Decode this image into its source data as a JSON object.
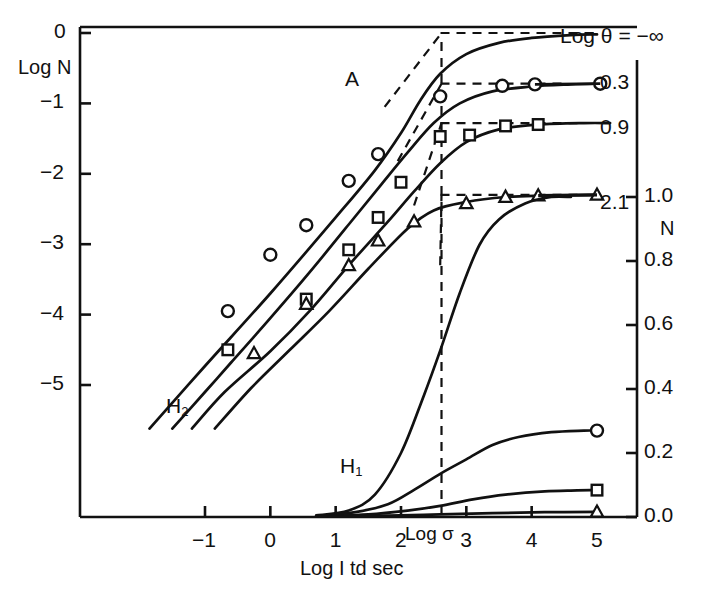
{
  "figure": {
    "left_axis_title": "Log N",
    "right_axis_title": "N",
    "x_axis_title": "Log I td sec",
    "sigma_annotation": "Log σ",
    "theta_legend": "Log θ = −∞",
    "curve_label_a": "A",
    "curve_label_h2": "H",
    "curve_label_h2_sub": "2",
    "curve_label_h1": "H",
    "curve_label_h1_sub": "1"
  },
  "axes": {
    "left_ticks": [
      "0",
      "−1",
      "−2",
      "−3",
      "−4",
      "−5"
    ],
    "left_values": [
      0,
      -1,
      -2,
      -3,
      -4,
      -5
    ],
    "right_ticks": [
      "1.0",
      "0.8",
      "0.6",
      "0.4",
      "0.2",
      "0.0"
    ],
    "right_values": [
      1.0,
      0.8,
      0.6,
      0.4,
      0.2,
      0.0
    ],
    "x_ticks": [
      "−1",
      "0",
      "1",
      "2",
      "3",
      "4",
      "5"
    ],
    "x_values": [
      -1,
      0,
      1,
      2,
      3,
      4,
      5
    ]
  },
  "theta_labels": [
    {
      "text": "Log θ = −∞",
      "y_logN": 0.0
    },
    {
      "text": "0.3",
      "y_logN": -0.72
    },
    {
      "text": "0.9",
      "y_logN": -1.28
    },
    {
      "text": "2.1",
      "y_logN": -2.3
    }
  ],
  "chart_data": {
    "type": "line",
    "title": "",
    "xlabel": "Log I td sec",
    "ylabel": "Log N",
    "ylabel_right": "N",
    "xlim": [
      -1.9,
      5.6
    ],
    "ylim": [
      -6.3,
      0.2
    ],
    "ylim_right": [
      0.0,
      1.0
    ],
    "grid": false,
    "legend": "right-margin, labelled by Log theta value",
    "annotations": [
      {
        "text": "Log θ = −∞",
        "x": 5.0,
        "y": 0.0
      },
      {
        "text": "0.3",
        "x": 5.4,
        "y": -0.72
      },
      {
        "text": "0.9",
        "x": 5.4,
        "y": -1.28
      },
      {
        "text": "2.1",
        "x": 5.4,
        "y": -2.3
      },
      {
        "text": "A",
        "x": 1.35,
        "y": -0.6
      },
      {
        "text": "H2",
        "x": 0.05,
        "y": -4.75
      },
      {
        "text": "H1",
        "x": 1.55,
        "y": -5.7
      },
      {
        "text": "Log σ",
        "x": 2.6,
        "y": -6.15
      }
    ],
    "vertical_dashed_line_x": 2.62,
    "series": [
      {
        "name": "Log θ = −∞",
        "marker": "none",
        "asymptote_logN": 0.0,
        "line": [
          [
            -1.85,
            -5.62
          ],
          [
            -1.0,
            -4.73
          ],
          [
            0.0,
            -3.7
          ],
          [
            1.0,
            -2.62
          ],
          [
            1.6,
            -1.95
          ],
          [
            2.0,
            -1.42
          ],
          [
            2.3,
            -0.95
          ],
          [
            2.6,
            -0.58
          ],
          [
            3.0,
            -0.3
          ],
          [
            3.5,
            -0.14
          ],
          [
            4.0,
            -0.07
          ],
          [
            4.6,
            -0.03
          ],
          [
            5.0,
            -0.02
          ]
        ],
        "points": []
      },
      {
        "name": "0.3",
        "marker": "circle",
        "asymptote_logN": -0.72,
        "line": [
          [
            -1.5,
            -5.62
          ],
          [
            -1.0,
            -5.1
          ],
          [
            -0.6,
            -4.68
          ],
          [
            0.0,
            -4.05
          ],
          [
            0.6,
            -3.4
          ],
          [
            1.2,
            -2.72
          ],
          [
            1.7,
            -2.15
          ],
          [
            2.1,
            -1.7
          ],
          [
            2.5,
            -1.28
          ],
          [
            2.9,
            -1.0
          ],
          [
            3.4,
            -0.83
          ],
          [
            4.0,
            -0.76
          ],
          [
            4.6,
            -0.73
          ],
          [
            5.05,
            -0.72
          ]
        ],
        "points": [
          [
            -0.65,
            -3.95
          ],
          [
            0.0,
            -3.15
          ],
          [
            0.55,
            -2.73
          ],
          [
            1.2,
            -2.1
          ],
          [
            1.65,
            -1.72
          ],
          [
            2.6,
            -0.9
          ],
          [
            3.55,
            -0.75
          ],
          [
            4.05,
            -0.73
          ],
          [
            5.05,
            -0.72
          ]
        ]
      },
      {
        "name": "0.9",
        "marker": "square",
        "asymptote_logN": -1.28,
        "line": [
          [
            -1.2,
            -5.62
          ],
          [
            -0.7,
            -5.1
          ],
          [
            0.0,
            -4.52
          ],
          [
            0.6,
            -3.95
          ],
          [
            1.2,
            -3.3
          ],
          [
            1.8,
            -2.68
          ],
          [
            2.2,
            -2.25
          ],
          [
            2.6,
            -1.85
          ],
          [
            3.0,
            -1.55
          ],
          [
            3.5,
            -1.37
          ],
          [
            4.1,
            -1.3
          ],
          [
            4.8,
            -1.28
          ],
          [
            5.2,
            -1.28
          ]
        ],
        "points": [
          [
            -0.65,
            -4.5
          ],
          [
            0.55,
            -3.78
          ],
          [
            1.2,
            -3.08
          ],
          [
            1.65,
            -2.62
          ],
          [
            2.0,
            -2.12
          ],
          [
            2.6,
            -1.47
          ],
          [
            3.05,
            -1.45
          ],
          [
            3.6,
            -1.32
          ],
          [
            4.1,
            -1.3
          ]
        ]
      },
      {
        "name": "2.1",
        "marker": "triangle",
        "asymptote_logN": -2.3,
        "line": [
          [
            -0.85,
            -5.62
          ],
          [
            -0.3,
            -5.05
          ],
          [
            0.3,
            -4.5
          ],
          [
            0.9,
            -3.95
          ],
          [
            1.5,
            -3.35
          ],
          [
            2.1,
            -2.78
          ],
          [
            2.5,
            -2.52
          ],
          [
            3.0,
            -2.4
          ],
          [
            3.6,
            -2.33
          ],
          [
            4.2,
            -2.31
          ],
          [
            5.0,
            -2.3
          ]
        ],
        "points": [
          [
            -0.25,
            -4.55
          ],
          [
            0.55,
            -3.85
          ],
          [
            1.2,
            -3.3
          ],
          [
            1.65,
            -2.95
          ],
          [
            2.2,
            -2.68
          ],
          [
            3.0,
            -2.42
          ],
          [
            3.6,
            -2.33
          ],
          [
            4.1,
            -2.31
          ],
          [
            5.0,
            -2.3
          ]
        ]
      },
      {
        "name": "H1 rising (N scale)",
        "marker": "none",
        "scale": "right",
        "line": [
          [
            0.7,
            0.005
          ],
          [
            1.2,
            0.02
          ],
          [
            1.6,
            0.07
          ],
          [
            2.0,
            0.2
          ],
          [
            2.35,
            0.38
          ],
          [
            2.6,
            0.52
          ],
          [
            2.9,
            0.7
          ],
          [
            3.2,
            0.85
          ],
          [
            3.5,
            0.93
          ],
          [
            3.9,
            0.98
          ],
          [
            4.3,
            1.0
          ],
          [
            4.6,
            1.0
          ]
        ],
        "points": []
      },
      {
        "name": "N circle curve",
        "marker": "circle",
        "scale": "right",
        "line": [
          [
            0.75,
            0.003
          ],
          [
            1.3,
            0.015
          ],
          [
            1.8,
            0.04
          ],
          [
            2.2,
            0.085
          ],
          [
            2.6,
            0.135
          ],
          [
            3.0,
            0.18
          ],
          [
            3.4,
            0.225
          ],
          [
            3.8,
            0.25
          ],
          [
            4.3,
            0.265
          ],
          [
            4.8,
            0.27
          ],
          [
            5.0,
            0.27
          ]
        ],
        "points": [
          [
            5.0,
            0.27
          ]
        ]
      },
      {
        "name": "N square curve",
        "marker": "square",
        "scale": "right",
        "line": [
          [
            0.8,
            0.002
          ],
          [
            1.5,
            0.008
          ],
          [
            2.1,
            0.02
          ],
          [
            2.6,
            0.035
          ],
          [
            3.1,
            0.055
          ],
          [
            3.6,
            0.07
          ],
          [
            4.2,
            0.08
          ],
          [
            4.7,
            0.083
          ],
          [
            5.0,
            0.084
          ]
        ],
        "points": [
          [
            5.0,
            0.084
          ]
        ]
      },
      {
        "name": "N triangle curve",
        "marker": "triangle",
        "scale": "right",
        "line": [
          [
            0.9,
            0.001
          ],
          [
            1.8,
            0.004
          ],
          [
            2.6,
            0.008
          ],
          [
            3.4,
            0.012
          ],
          [
            4.2,
            0.015
          ],
          [
            5.0,
            0.016
          ]
        ],
        "points": [
          [
            5.0,
            0.016
          ]
        ]
      }
    ],
    "dashed_asymptotes": [
      {
        "series": "Log θ = −∞",
        "y_logN": 0.0,
        "x_from": 2.62,
        "x_to": 5.0,
        "knee_x": 2.62,
        "knee_from": [
          1.75,
          -1.05
        ]
      },
      {
        "series": "0.3",
        "y_logN": -0.72,
        "x_from": 2.62,
        "x_to": 4.55,
        "knee_x": 2.62,
        "knee_from": [
          1.95,
          -1.82
        ]
      },
      {
        "series": "0.9",
        "y_logN": -1.28,
        "x_from": 2.62,
        "x_to": 4.75,
        "knee_x": 2.62,
        "knee_from": [
          2.2,
          -2.45
        ]
      },
      {
        "series": "2.1",
        "y_logN": -2.3,
        "x_from": 2.62,
        "x_to": 4.75,
        "knee_x": 2.62,
        "knee_from": [
          2.6,
          -3.3
        ]
      }
    ]
  }
}
